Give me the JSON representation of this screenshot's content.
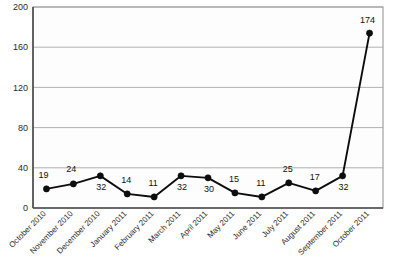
{
  "chart_data": {
    "type": "line",
    "title": "",
    "subtitle": "",
    "xlabel": "",
    "ylabel": "",
    "categories": [
      "October 2010",
      "November 2010",
      "December 2010",
      "January 2011",
      "February 2011",
      "March 2011",
      "April 2011",
      "May 2011",
      "June 2011",
      "July 2011",
      "August 2011",
      "September 2011",
      "October 2011"
    ],
    "values": [
      19,
      24,
      32,
      14,
      11,
      32,
      30,
      15,
      11,
      25,
      17,
      32,
      174
    ],
    "data_labels": [
      "19",
      "24",
      "32",
      "14",
      "11",
      "32",
      "30",
      "15",
      "11",
      "25",
      "17",
      "32",
      "174"
    ],
    "ylim": [
      0,
      200
    ],
    "xlim_categories": 13,
    "ytick_values": [
      0,
      40,
      80,
      120,
      160,
      200
    ],
    "ytick_labels": [
      "0",
      "40",
      "80",
      "120",
      "160",
      "200"
    ],
    "grid": true,
    "grid_axis": "y",
    "legend": false,
    "legend_position": "none",
    "marker": "filled-circle",
    "series": [
      {
        "name": "",
        "values": [
          19,
          24,
          32,
          14,
          11,
          32,
          30,
          15,
          11,
          25,
          17,
          32,
          174
        ]
      }
    ],
    "xtick_rotation_degrees": -45,
    "colors": {
      "line": "#0d0d0d",
      "marker": "#0d0d0d",
      "grid": "#a9a9a9",
      "axis": "#4a4a4a",
      "plot_background": "#fdfdfd",
      "page_background": "#ffffff",
      "text": "#1a1a1a"
    },
    "label_offsets": [
      {
        "dx": -3,
        "dy": -11,
        "anchor": "middle"
      },
      {
        "dx": -2,
        "dy": -12,
        "anchor": "middle"
      },
      {
        "dx": 1,
        "dy": 14,
        "anchor": "middle"
      },
      {
        "dx": -1,
        "dy": -11,
        "anchor": "middle"
      },
      {
        "dx": -1,
        "dy": -11,
        "anchor": "middle"
      },
      {
        "dx": 1,
        "dy": 14,
        "anchor": "middle"
      },
      {
        "dx": 1,
        "dy": 14,
        "anchor": "middle"
      },
      {
        "dx": -1,
        "dy": -11,
        "anchor": "middle"
      },
      {
        "dx": -1,
        "dy": -11,
        "anchor": "middle"
      },
      {
        "dx": -1,
        "dy": -11,
        "anchor": "middle"
      },
      {
        "dx": -1,
        "dy": -11,
        "anchor": "middle"
      },
      {
        "dx": 1,
        "dy": 14,
        "anchor": "middle"
      },
      {
        "dx": -2,
        "dy": -10,
        "anchor": "middle"
      }
    ]
  }
}
